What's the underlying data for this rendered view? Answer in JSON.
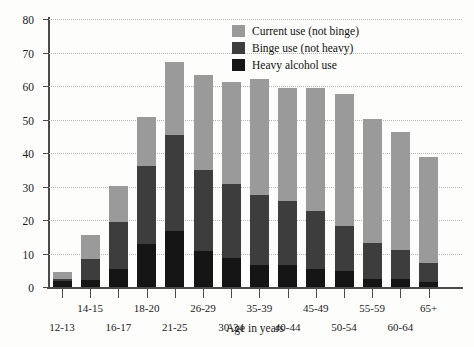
{
  "chart_data": {
    "type": "bar",
    "stacked": true,
    "title": "",
    "xlabel": "Age in years",
    "ylabel": "Percent using in past month",
    "ylim": [
      0,
      80
    ],
    "yticks": [
      0,
      10,
      20,
      30,
      40,
      50,
      60,
      70,
      80
    ],
    "grid": "horizontal-dotted",
    "legend_position": "top-right",
    "categories": [
      "12-13",
      "14-15",
      "16-17",
      "18-20",
      "21-25",
      "26-29",
      "30-34",
      "35-39",
      "40-44",
      "45-49",
      "50-54",
      "55-59",
      "60-64",
      "65+"
    ],
    "series": [
      {
        "name": "Heavy alcohol use",
        "color": "#151515",
        "values": [
          1.7,
          2.2,
          5.5,
          12.9,
          16.7,
          10.7,
          8.6,
          6.5,
          6.6,
          5.4,
          4.7,
          2.4,
          2.4,
          1.4
        ]
      },
      {
        "name": "Binge use (not heavy)",
        "color": "#3d3d3d",
        "values": [
          0.8,
          6.1,
          14.0,
          23.1,
          28.8,
          24.1,
          22.2,
          21.0,
          19.1,
          17.4,
          13.5,
          10.6,
          8.6,
          5.8
        ]
      },
      {
        "name": "Current use (not binge)",
        "color": "#9a9a9a",
        "values": [
          2.0,
          7.1,
          10.7,
          14.9,
          21.8,
          28.4,
          30.5,
          34.5,
          33.8,
          36.7,
          39.3,
          37.1,
          35.4,
          31.6
        ]
      }
    ],
    "cumulative_tops": {
      "heavy": [
        1.7,
        2.2,
        5.5,
        12.9,
        16.7,
        10.7,
        8.6,
        6.5,
        6.6,
        5.4,
        4.7,
        2.4,
        2.4,
        1.4
      ],
      "binge": [
        2.5,
        8.3,
        19.5,
        36.0,
        45.5,
        34.8,
        30.8,
        27.5,
        25.7,
        22.8,
        18.2,
        13.0,
        11.0,
        7.2
      ],
      "total": [
        4.5,
        15.4,
        30.2,
        50.9,
        67.3,
        63.2,
        61.3,
        62.0,
        59.5,
        59.5,
        57.5,
        50.1,
        46.4,
        38.8
      ]
    }
  },
  "legend": {
    "items": [
      {
        "label": "Current use (not binge)",
        "color": "#9a9a9a"
      },
      {
        "label": "Binge use (not heavy)",
        "color": "#3d3d3d"
      },
      {
        "label": "Heavy alcohol use",
        "color": "#151515"
      }
    ]
  }
}
